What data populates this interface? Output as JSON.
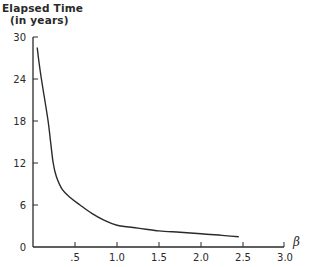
{
  "chart_data": {
    "type": "line",
    "title": "",
    "ylabel_line1": "Elapsed Time",
    "ylabel_line2": "(in years)",
    "xlabel": "β",
    "xlim": [
      0,
      3.0
    ],
    "ylim": [
      0,
      30
    ],
    "grid": false,
    "legend": null,
    "x_ticks": [
      ".5",
      "1.0",
      "1.5",
      "2.0",
      "2.5",
      "3.0"
    ],
    "x_tick_values": [
      0.5,
      1.0,
      1.5,
      2.0,
      2.5,
      3.0
    ],
    "y_ticks": [
      "0",
      "6",
      "12",
      "18",
      "24",
      "30"
    ],
    "y_tick_values": [
      0,
      6,
      12,
      18,
      24,
      30
    ],
    "series": [
      {
        "name": "Elapsed Time",
        "x": [
          0.05,
          0.07,
          0.1,
          0.14,
          0.18,
          0.21,
          0.24,
          0.28,
          0.35,
          0.45,
          0.56,
          0.7,
          0.85,
          1.0,
          1.25,
          1.5,
          1.75,
          2.0,
          2.25,
          2.45
        ],
        "y": [
          28.5,
          26.5,
          24,
          21,
          18,
          15,
          12,
          10,
          8.2,
          7,
          6,
          4.8,
          3.8,
          3.1,
          2.7,
          2.3,
          2.1,
          1.9,
          1.65,
          1.45
        ]
      }
    ]
  }
}
